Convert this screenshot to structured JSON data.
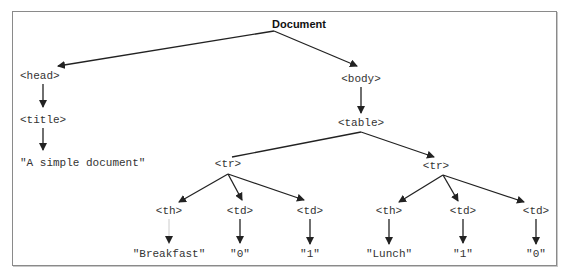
{
  "diagram": {
    "type": "DOM tree",
    "root": {
      "label": "Document"
    },
    "nodes": {
      "head": "<head>",
      "title": "<title>",
      "title_text": "\"A simple document\"",
      "body": "<body>",
      "table": "<table>",
      "tr1": "<tr>",
      "tr1_th": "<th>",
      "tr1_td1": "<td>",
      "tr1_td2": "<td>",
      "tr1_th_text": "\"Breakfast\"",
      "tr1_td1_text": "\"0\"",
      "tr1_td2_text": "\"1\"",
      "tr2": "<tr>",
      "tr2_th": "<th>",
      "tr2_td1": "<td>",
      "tr2_td2": "<td>",
      "tr2_th_text": "\"Lunch\"",
      "tr2_td1_text": "\"1\"",
      "tr2_td2_text": "\"0\""
    },
    "colors": {
      "line": "#222222",
      "text": "#333333",
      "border": "#8a8a8a"
    }
  }
}
